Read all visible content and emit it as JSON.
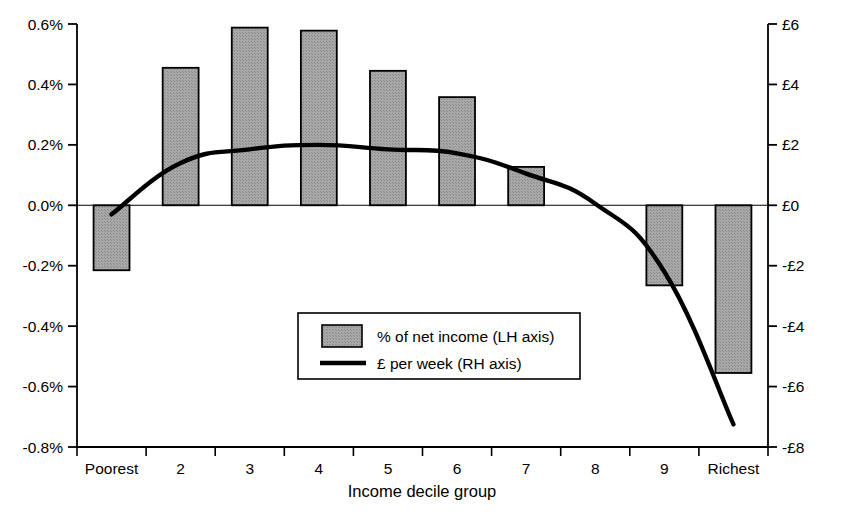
{
  "chart_data": {
    "type": "bar",
    "title": "",
    "subtitle": "",
    "xlabel": "Income decile group",
    "ylabel": "",
    "categories": [
      "Poorest",
      "2",
      "3",
      "4",
      "5",
      "6",
      "7",
      "8",
      "9",
      "Richest"
    ],
    "grid": false,
    "legend_position": "inside-bottom-center",
    "left_axis": {
      "label": "",
      "unit": "%",
      "ylim": [
        -0.8,
        0.6
      ],
      "ticks": [
        0.6,
        0.4,
        0.2,
        0.0,
        -0.2,
        -0.4,
        -0.6,
        -0.8
      ],
      "tick_labels": [
        "0.6%",
        "0.4%",
        "0.2%",
        "0.0%",
        "-0.2%",
        "-0.4%",
        "-0.6%",
        "-0.8%"
      ]
    },
    "right_axis": {
      "label": "",
      "unit": "£",
      "ylim": [
        -8,
        6
      ],
      "ticks": [
        6,
        4,
        2,
        0,
        -2,
        -4,
        -6,
        -8
      ],
      "tick_labels": [
        "£6",
        "£4",
        "£2",
        "£0",
        "-£2",
        "-£4",
        "-£6",
        "-£8"
      ]
    },
    "series": [
      {
        "name": "% of net income (LH axis)",
        "type": "bar",
        "axis": "left",
        "fill": "#9e9e9e",
        "stroke": "#000000",
        "values": [
          -0.215,
          0.455,
          0.588,
          0.578,
          0.445,
          0.358,
          0.127,
          0.0,
          -0.265,
          -0.555
        ]
      },
      {
        "name": "£ per week (RH axis)",
        "type": "line",
        "axis": "right",
        "stroke": "#000000",
        "values": [
          -0.3,
          1.4,
          1.85,
          2.0,
          1.85,
          1.72,
          1.05,
          0.05,
          -2.2,
          -7.25
        ]
      }
    ],
    "legend": [
      {
        "label": "% of net income (LH axis)",
        "marker": "swatch"
      },
      {
        "label": "£ per week (RH axis)",
        "marker": "line"
      }
    ],
    "colors": {
      "bar_fill": "#9e9e9e",
      "bar_stroke": "#000000",
      "line": "#000000",
      "axis": "#000000",
      "background": "#ffffff"
    }
  }
}
